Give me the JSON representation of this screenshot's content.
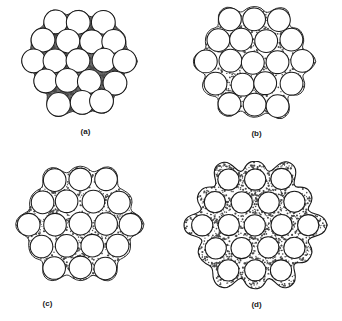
{
  "figure": {
    "background_color": "#ffffff",
    "line_color": "#1a1a1a",
    "sphere_fill": "#ffffff",
    "matrix_color": "#4a4a4a"
  },
  "panels": [
    {
      "id": "a",
      "caption": "(a)",
      "description": "Densely packed spheres in direct contact; small dark triangular interstitial pores",
      "sphere_count": 21,
      "matrix_fraction": 0.06,
      "stipple_density": "very-high",
      "packing": "irregular-contact"
    },
    {
      "id": "b",
      "caption": "(b)",
      "description": "Spheres separated by a thin stippled matrix; moderate interstitial area",
      "sphere_count": 20,
      "matrix_fraction": 0.18,
      "stipple_density": "medium",
      "packing": "near-contact"
    },
    {
      "id": "c",
      "caption": "(c)",
      "description": "Hexagonally arranged spheres with broader stippled matrix channels",
      "sphere_count": 19,
      "matrix_fraction": 0.26,
      "stipple_density": "medium",
      "packing": "hexagonal"
    },
    {
      "id": "d",
      "caption": "(d)",
      "description": "Well separated spheres fully embedded in a continuous stippled matrix with smooth rounded outer boundary",
      "sphere_count": 19,
      "matrix_fraction": 0.4,
      "stipple_density": "high",
      "packing": "hexagonal-dispersed"
    }
  ],
  "chart_data": {
    "type": "diagram",
    "categories": [
      "(a)",
      "(b)",
      "(c)",
      "(d)"
    ],
    "series": [
      {
        "name": "Matrix area fraction",
        "values": [
          0.06,
          0.18,
          0.26,
          0.4
        ]
      },
      {
        "name": "Sphere count",
        "values": [
          21,
          20,
          19,
          19
        ]
      }
    ],
    "xlabel": "Panel",
    "ylabel": "Matrix area fraction",
    "legend": "none",
    "grid": false
  }
}
